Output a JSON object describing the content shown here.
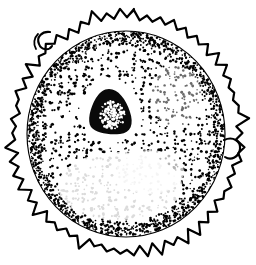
{
  "figure": {
    "medium": "pen-and-ink stipple drawing",
    "ink_color": "#000000",
    "background_color": "#ffffff",
    "canvas": {
      "width": 256,
      "height": 265
    },
    "header_remnant": {
      "visible": true,
      "text": "",
      "note": "faint cropped line of text along the very top edge, illegible"
    },
    "parts": [
      {
        "name": "outer-spiny-membrane",
        "label": "Outer spiny membrane",
        "description": "irregular jagged spike fringe around the whole cell",
        "stroke_color": "#000000",
        "stroke_width": 2.2,
        "spike_count": 54,
        "center": {
          "cx": 127,
          "cy": 133
        },
        "radius": {
          "rx": 112,
          "ry": 116
        }
      },
      {
        "name": "inner-membrane-ring",
        "label": "Inner membrane ring",
        "description": "thin continuous circle just inside the spiny fringe",
        "stroke_color": "#000000",
        "stroke_width": 1.1,
        "center": {
          "cx": 126,
          "cy": 134
        },
        "radius": {
          "rx": 99,
          "ry": 103
        }
      },
      {
        "name": "cytoplasm-stipple-field",
        "label": "Cytoplasm stipple field",
        "description": "dense dot stippling filling the cell body, densest at the rim",
        "dot_color": "#000000",
        "dot_radius_min": 0.7,
        "dot_radius_max": 1.5,
        "dot_count": 1650
      },
      {
        "name": "nucleus",
        "label": "Nucleus",
        "description": "solid dark rounded-triangular mass set above and left of center, mottled with white flecks",
        "fill_color": "#0a0a0a",
        "center": {
          "cx": 110,
          "cy": 111
        },
        "size": {
          "width": 38,
          "height": 44
        }
      },
      {
        "name": "right-bud-loop",
        "label": "Right bud loop",
        "description": "small closed loop budding off the right edge of the membrane",
        "center": {
          "cx": 230,
          "cy": 148
        },
        "size": {
          "width": 16,
          "height": 17
        }
      },
      {
        "name": "upper-left-hook",
        "label": "Upper-left hook",
        "description": "small hooked loop protruding from the upper-left membrane",
        "center": {
          "cx": 45,
          "cy": 40
        },
        "size": {
          "width": 16,
          "height": 18
        }
      },
      {
        "name": "pale-vacuole-zone",
        "label": "Pale vacuole zone",
        "description": "sparsely stippled pale crescent in the lower-central region of the cell"
      }
    ]
  }
}
